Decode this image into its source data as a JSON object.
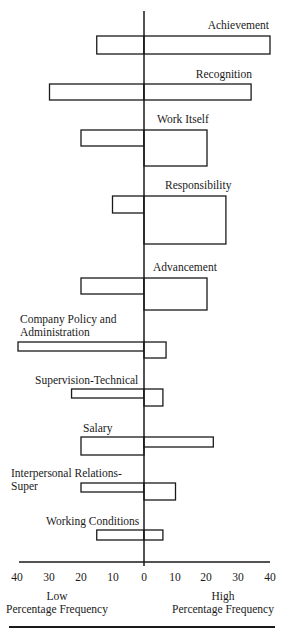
{
  "chart_data": {
    "type": "bar",
    "orientation": "diverging-horizontal",
    "title": "",
    "xlabel_left": [
      "Low",
      "Percentage Frequency"
    ],
    "xlabel_right": [
      "High",
      "Percentage Frequency"
    ],
    "x_ticks": [
      40,
      30,
      20,
      10,
      0,
      10,
      20,
      30,
      40
    ],
    "xlim": [
      -40,
      40
    ],
    "grid": false,
    "legend": null,
    "categories": [
      "Achievement",
      "Recognition",
      "Work Itself",
      "Responsibility",
      "Advancement",
      "Company Policy and Administration",
      "Supervision-Technical",
      "Salary",
      "Interpersonal Relations-Super",
      "Working Conditions"
    ],
    "series": [
      {
        "name": "Low (dissatisfaction) percentage frequency",
        "values": [
          15,
          30,
          20,
          10,
          20,
          40,
          23,
          20,
          20,
          15
        ]
      },
      {
        "name": "High (satisfaction) percentage frequency",
        "values": [
          40,
          34,
          20,
          26,
          20,
          7,
          6,
          22,
          10,
          6
        ]
      }
    ],
    "bar_thickness_note": "Bar height proportional to duration of attitude; high-side bars for Work Itself, Responsibility, Advancement are taller"
  },
  "layout": {
    "center_x": 144,
    "px_per_unit": 3.15,
    "axis_y": 562,
    "axis_top_y": 11,
    "bars": [
      {
        "label": "Achievement",
        "label_lines": [
          "Achievement"
        ],
        "label_anchor": "end",
        "label_x": 269,
        "label_y": 29,
        "low_top": 36,
        "low_bottom": 54,
        "high_top": 36,
        "high_bottom": 54
      },
      {
        "label": "Recognition",
        "label_lines": [
          "Recognition"
        ],
        "label_anchor": "end",
        "label_x": 252,
        "label_y": 78,
        "low_top": 84,
        "low_bottom": 100,
        "high_top": 84,
        "high_bottom": 100
      },
      {
        "label": "Work Itself",
        "label_lines": [
          "Work Itself"
        ],
        "label_anchor": "start",
        "label_x": 157,
        "label_y": 123,
        "low_top": 130,
        "low_bottom": 146,
        "high_top": 130,
        "high_bottom": 166
      },
      {
        "label": "Responsibility",
        "label_lines": [
          "Responsibility"
        ],
        "label_anchor": "start",
        "label_x": 165,
        "label_y": 189,
        "low_top": 196,
        "low_bottom": 213,
        "high_top": 196,
        "high_bottom": 244
      },
      {
        "label": "Advancement",
        "label_lines": [
          "Advancement"
        ],
        "label_anchor": "start",
        "label_x": 153,
        "label_y": 271,
        "low_top": 278,
        "low_bottom": 294,
        "high_top": 278,
        "high_bottom": 310
      },
      {
        "label": "Company Policy and Administration",
        "label_lines": [
          "Company Policy and",
          "Administration"
        ],
        "label_anchor": "start",
        "label_x": 20,
        "label_y": 323,
        "low_top": 342,
        "low_bottom": 351,
        "high_top": 342,
        "high_bottom": 358
      },
      {
        "label": "Supervision-Technical",
        "label_lines": [
          "Supervision-Technical"
        ],
        "label_anchor": "start",
        "label_x": 35,
        "label_y": 384,
        "low_top": 389,
        "low_bottom": 398,
        "high_top": 389,
        "high_bottom": 406
      },
      {
        "label": "Salary",
        "label_lines": [
          "Salary"
        ],
        "label_anchor": "start",
        "label_x": 83,
        "label_y": 432,
        "low_top": 437,
        "low_bottom": 455,
        "high_top": 437,
        "high_bottom": 447
      },
      {
        "label": "Interpersonal Relations-Super",
        "label_lines": [
          "Interpersonal Relations-",
          "Super"
        ],
        "label_anchor": "start",
        "label_x": 11,
        "label_y": 477,
        "low_top": 483,
        "low_bottom": 492,
        "high_top": 483,
        "high_bottom": 500
      },
      {
        "label": "Working Conditions",
        "label_lines": [
          "Working Conditions"
        ],
        "label_anchor": "start",
        "label_x": 46,
        "label_y": 525,
        "low_top": 530,
        "low_bottom": 540,
        "high_top": 530,
        "high_bottom": 540
      }
    ],
    "tick_positions": [
      17,
      49,
      81,
      113,
      144,
      175,
      206,
      238,
      270
    ],
    "tick_label_y": 581,
    "left_title_x": 57,
    "right_title_x": 223,
    "title_line1_y": 600,
    "title_line2_y": 613,
    "footer_rule_y": 627
  }
}
